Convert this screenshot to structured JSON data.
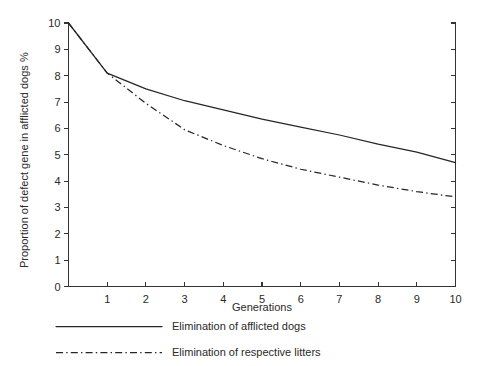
{
  "chart_data": {
    "type": "line",
    "title": "",
    "xlabel": "Generations",
    "ylabel": "Proportion of defect gene in afflicted dogs  %",
    "xlim": [
      0,
      10
    ],
    "ylim": [
      0,
      10
    ],
    "grid": false,
    "legend_position": "below-plot-left",
    "x_ticks": [
      1,
      2,
      3,
      4,
      5,
      6,
      7,
      8,
      9,
      10
    ],
    "x_tick_labels": [
      "1",
      "2",
      "3",
      "4",
      "5",
      "6",
      "7",
      "8",
      "9",
      "10"
    ],
    "y_ticks": [
      0,
      1,
      2,
      3,
      4,
      5,
      6,
      7,
      8,
      9,
      10
    ],
    "y_tick_labels": [
      "0",
      "1",
      "2",
      "3",
      "4",
      "5",
      "6",
      "7",
      "8",
      "9",
      "10"
    ],
    "x": [
      0,
      1,
      2,
      3,
      4,
      5,
      6,
      7,
      8,
      9,
      10
    ],
    "series": [
      {
        "name": "Elimination of afflicted dogs",
        "style": "solid",
        "values": [
          10.0,
          8.1,
          7.5,
          7.05,
          6.7,
          6.35,
          6.05,
          5.75,
          5.4,
          5.1,
          4.7
        ]
      },
      {
        "name": "Elimination of respective litters",
        "style": "dash-dot",
        "values": [
          10.0,
          8.1,
          6.95,
          5.95,
          5.35,
          4.85,
          4.45,
          4.15,
          3.85,
          3.6,
          3.4
        ]
      }
    ]
  },
  "axes": {
    "y_axis_title": "Proportion of defect gene in afflicted dogs  %",
    "x_axis_title": "Generations"
  },
  "legend": {
    "entries": [
      {
        "label": "Elimination of afflicted dogs",
        "style": "solid"
      },
      {
        "label": "Elimination of respective litters",
        "style": "dash-dot"
      }
    ]
  },
  "colors": {
    "background": "#ffffff",
    "ink": "#262626",
    "axis": "#333333"
  }
}
